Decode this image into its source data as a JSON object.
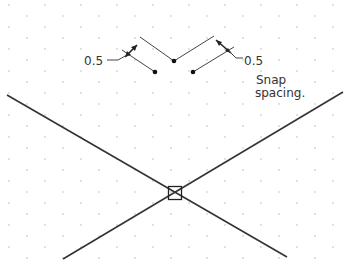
{
  "diagram": {
    "colors": {
      "background": "#ffffff",
      "grid_dot": "#bdbdbd",
      "line": "#333333",
      "thin_line": "#555555"
    },
    "grid": {
      "type": "staggered-dot-grid",
      "dx": 36,
      "dy": 22,
      "offset_x": 9,
      "offset_y": 5
    },
    "labels": {
      "left_dimension": "0.5",
      "right_dimension": "0.5",
      "snap_line1": "Snap",
      "snap_line2": "spacing."
    },
    "points": {
      "center_dot": [
        174,
        61
      ],
      "left_dot": [
        155,
        72
      ],
      "right_dot": [
        193,
        72
      ],
      "intersection": [
        175,
        193
      ]
    },
    "big_lines": [
      {
        "from": [
          7,
          95
        ],
        "to": [
          287,
          257
        ]
      },
      {
        "from": [
          343,
          92
        ],
        "to": [
          63,
          259
        ]
      }
    ],
    "marker": {
      "type": "snap-box",
      "size": 13
    }
  }
}
